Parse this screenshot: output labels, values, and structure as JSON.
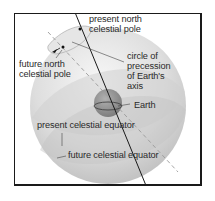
{
  "diagram": {
    "title": "Precession of Earth's axis",
    "labels": {
      "present_north_pole": [
        "present north",
        "celestial pole"
      ],
      "future_north_pole": [
        "future north",
        "celestial pole"
      ],
      "precession_circle": [
        "circle of",
        "precession",
        "of Earth's",
        "axis"
      ],
      "earth": "Earth",
      "present_equator": "present celestial equator",
      "future_equator": "future celestial equator"
    },
    "colors": {
      "sphere_light": "#f2f2f2",
      "sphere_mid": "#d6d6d6",
      "sphere_dark": "#b9b9b9",
      "earth": "#8f8f8f",
      "line": "#1a1a1a",
      "dashed_line": "#9a9a9a",
      "text": "#2a2a2a"
    }
  }
}
